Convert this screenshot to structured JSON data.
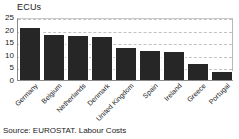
{
  "chart_data": {
    "type": "bar",
    "title": "",
    "subtitle": "",
    "unit_label": "ECUs",
    "xlabel": "",
    "ylabel": "ECUs",
    "ylim": [
      0,
      25
    ],
    "yticks": [
      0,
      5,
      10,
      15,
      20,
      25
    ],
    "ytick_labels": [
      "0",
      "5",
      "10",
      "15",
      "20",
      "25"
    ],
    "grid": true,
    "grid_axis": "y",
    "grid_style": "dashed",
    "legend": false,
    "legend_position": "none",
    "bar_color": "#262626",
    "categories": [
      "Germany",
      "Belgium",
      "Netherlands",
      "Denmark",
      "United Kingdom",
      "Spain",
      "Ireland",
      "Greece",
      "Portugal"
    ],
    "values": [
      21.0,
      18.3,
      17.7,
      17.3,
      13.0,
      12.0,
      11.5,
      6.7,
      3.7
    ],
    "annotations": [
      "Source: EUROSTAT. Labour Costs"
    ]
  },
  "source": {
    "text": "Source: EUROSTAT. Labour Costs"
  }
}
